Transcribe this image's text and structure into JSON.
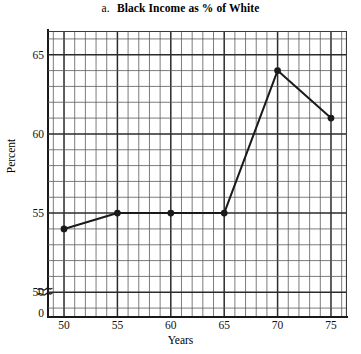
{
  "chart_data": {
    "type": "line",
    "title": "Black Income as % of White",
    "title_index": "a.",
    "xlabel": "Years",
    "ylabel": "Percent",
    "x": [
      50,
      55,
      60,
      65,
      70,
      75
    ],
    "values": [
      54,
      55,
      55,
      55,
      64,
      61
    ],
    "series": [
      {
        "name": "Black Income as % of White",
        "values": [
          54,
          55,
          55,
          55,
          64,
          61
        ]
      }
    ],
    "xtick_labels": [
      "50",
      "55",
      "60",
      "65",
      "70",
      "75"
    ],
    "ytick_labels": [
      "0",
      "50",
      "55",
      "60",
      "65"
    ],
    "xlim": [
      48.5,
      76.5
    ],
    "ylim": [
      48.5,
      66.5
    ],
    "axis_break": true,
    "axis_break_symbol": "≈",
    "grid": true,
    "grid_minor_step_x": 1,
    "grid_minor_step_y": 1,
    "grid_major_step_x": 5,
    "grid_major_step_y": 5,
    "legend": "none",
    "marker": "filled-circle",
    "line_color": "#1a1a1a",
    "grid_color": "#4a4a4a",
    "background_color": "#ffffff"
  }
}
